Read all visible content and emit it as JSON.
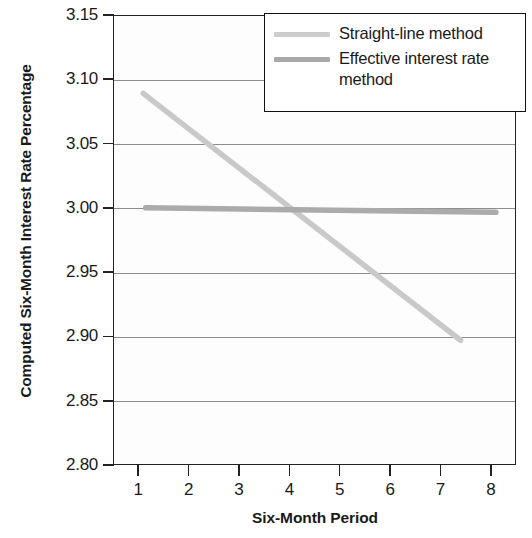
{
  "chart_data": {
    "type": "line",
    "title": "",
    "xlabel": "Six-Month Period",
    "ylabel": "Computed Six-Month Interest Rate Percentage",
    "xlim": [
      0.5,
      8.5
    ],
    "ylim": [
      2.8,
      3.15
    ],
    "xticks": [
      1,
      2,
      3,
      4,
      5,
      6,
      7,
      8
    ],
    "xtick_labels": [
      "1",
      "2",
      "3",
      "4",
      "5",
      "6",
      "7",
      "8"
    ],
    "yticks": [
      2.8,
      2.85,
      2.9,
      2.95,
      3.0,
      3.05,
      3.1,
      3.15
    ],
    "ytick_labels": [
      "2.80",
      "2.85",
      "2.90",
      "2.95",
      "3.00",
      "3.05",
      "3.10",
      "3.15"
    ],
    "grid": true,
    "grid_axis": "y",
    "legend_position": "top-right",
    "series": [
      {
        "name": "Straight-line method",
        "color": "#c9c9c9",
        "x": [
          1.1,
          7.4
        ],
        "values": [
          3.089,
          2.897
        ]
      },
      {
        "name": "Effective interest rate method",
        "color": "#ababab",
        "x": [
          1.15,
          8.1
        ],
        "values": [
          3.0,
          2.9965
        ]
      }
    ]
  },
  "legend": {
    "items": [
      {
        "label": "Straight-line method",
        "swatch_color": "#cdcdcd"
      },
      {
        "label": "Effective interest rate method",
        "swatch_color": "#a9a9a9"
      }
    ]
  },
  "axes": {
    "y_title": "Computed Six-Month Interest Rate Percentage",
    "x_title": "Six-Month Period"
  }
}
